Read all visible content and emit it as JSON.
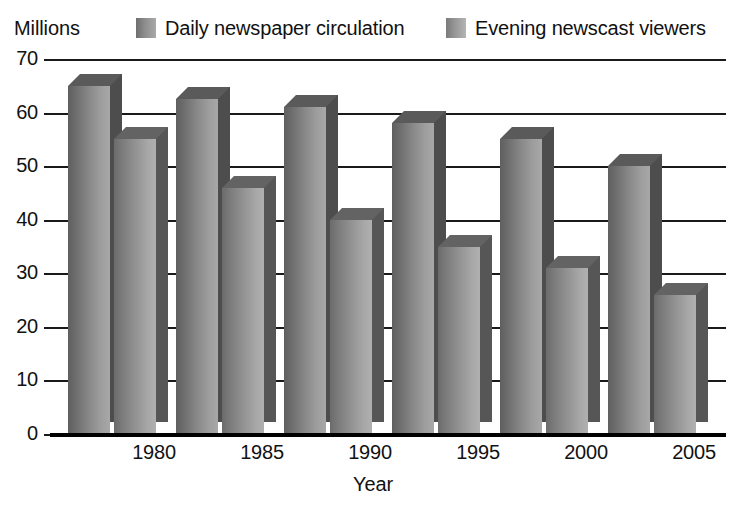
{
  "chart_data": {
    "type": "bar",
    "title": "",
    "subtitle": "",
    "xlabel": "Year",
    "ylabel": "Millions",
    "ylim": [
      0,
      70
    ],
    "ytick_step": 10,
    "yticks": [
      "70",
      "60",
      "50",
      "40",
      "30",
      "20",
      "10",
      "0"
    ],
    "grid": true,
    "legend_position": "top",
    "categories": [
      "1980",
      "1985",
      "1990",
      "1995",
      "2000",
      "2005"
    ],
    "series": [
      {
        "name": "Daily newspaper circulation",
        "swatch_icon": "legend-swatch-icon",
        "color": "#8a8a8a",
        "values": [
          65,
          62.5,
          61,
          58,
          55,
          50
        ]
      },
      {
        "name": "Evening newscast viewers",
        "swatch_icon": "legend-swatch-icon",
        "color": "#9a9a9a",
        "values": [
          55,
          46,
          40,
          35,
          31,
          26
        ]
      }
    ]
  },
  "axis": {
    "unit_label": "Millions",
    "x_title": "Year"
  },
  "colors": {
    "axis": "#000000",
    "gridline": "#1a1a1a",
    "background": "#ffffff",
    "series_0": "#8a8a8a",
    "series_1": "#9a9a9a"
  }
}
